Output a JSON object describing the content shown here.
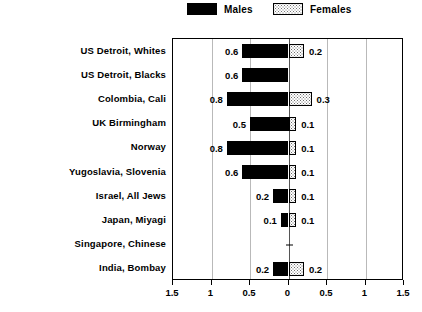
{
  "legend": {
    "males_label": "Males",
    "females_label": "Females",
    "males_color": "#000000",
    "females_color": "#d9d9d9"
  },
  "axis": {
    "tick_labels": [
      "1.5",
      "1",
      "0.5",
      "0",
      "0.5",
      "1",
      "1.5"
    ],
    "tick_values": [
      -1.5,
      -1.0,
      -0.5,
      0,
      0.5,
      1.0,
      1.5
    ],
    "gridline_values": [
      -1.0,
      -0.5,
      0.5,
      1.0
    ]
  },
  "chart_data": {
    "type": "bar",
    "title": "",
    "subtitle": "",
    "xlabel": "",
    "ylabel": "",
    "orientation": "horizontal",
    "style": "population-pyramid",
    "xlim": [
      -1.5,
      1.5
    ],
    "grid": true,
    "legend_position": "top-center",
    "categories": [
      "US Detroit, Whites",
      "US Detroit, Blacks",
      "Colombia, Cali",
      "UK Birmingham",
      "Norway",
      "Yugoslavia, Slovenia",
      "Israel, All Jews",
      "Japan, Miyagi",
      "Singapore, Chinese",
      "India, Bombay"
    ],
    "series": [
      {
        "name": "Males",
        "direction": "left",
        "values": [
          0.6,
          0.6,
          0.8,
          0.5,
          0.8,
          0.6,
          0.2,
          0.1,
          null,
          0.2
        ],
        "labels": [
          "0.6",
          "0.6",
          "0.8",
          "0.5",
          "0.8",
          "0.6",
          "0.2",
          "0.1",
          "",
          "0.2"
        ]
      },
      {
        "name": "Females",
        "direction": "right",
        "values": [
          0.2,
          null,
          0.3,
          0.1,
          0.1,
          0.1,
          0.1,
          0.1,
          null,
          0.2
        ],
        "labels": [
          "0.2",
          "",
          "0.3",
          "0.1",
          "0.1",
          "0.1",
          "0.1",
          "0.1",
          "",
          "0.2"
        ]
      }
    ]
  }
}
